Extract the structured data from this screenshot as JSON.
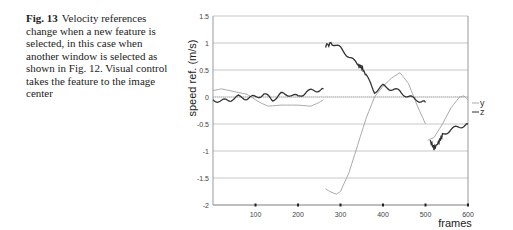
{
  "caption": {
    "label": "Fig. 13",
    "text": "Velocity references change when a new feature is selected, in this case when another window is selected as shown in Fig. 12. Visual control takes the feature to the image center"
  },
  "chart_data": {
    "type": "line",
    "title": "",
    "xlabel": "frames",
    "ylabel": "speed ref. (m/s)",
    "xlim": [
      0,
      600
    ],
    "ylim": [
      -2,
      1.5
    ],
    "xticks": [
      100,
      200,
      300,
      400,
      500,
      600
    ],
    "yticks": [
      1.5,
      1,
      0.5,
      0,
      -0.5,
      -1,
      -1.5,
      -2
    ],
    "grid": "horizontal",
    "legend_position": "right",
    "series": [
      {
        "name": "y",
        "color": "#aaaaaa",
        "segments": [
          {
            "x": [
              0,
              20,
              50,
              80,
              110,
              130,
              160,
              200,
              230,
              250,
              260
            ],
            "y": [
              0.12,
              0.15,
              0.1,
              0.05,
              -0.1,
              -0.17,
              -0.15,
              -0.15,
              -0.17,
              -0.1,
              -0.05
            ]
          },
          {
            "x": [
              265,
              275,
              290,
              300,
              320,
              340,
              360,
              380,
              400,
              420,
              440,
              460,
              480,
              500
            ],
            "y": [
              -1.7,
              -1.75,
              -1.8,
              -1.75,
              -1.4,
              -0.9,
              -0.4,
              0.0,
              0.2,
              0.35,
              0.45,
              0.25,
              -0.15,
              -0.5
            ]
          },
          {
            "x": [
              505,
              520,
              540,
              560,
              580,
              590,
              600
            ],
            "y": [
              -0.8,
              -0.75,
              -0.5,
              -0.2,
              0.0,
              0.02,
              -0.05
            ]
          }
        ]
      },
      {
        "name": "z",
        "color": "#333333",
        "segments": [
          {
            "x": [
              0,
              20,
              40,
              60,
              80,
              100,
              120,
              140,
              160,
              180,
              200,
              220,
              240,
              260
            ],
            "y": [
              -0.05,
              -0.08,
              -0.05,
              0.0,
              -0.02,
              0.0,
              0.05,
              -0.05,
              0.05,
              0.05,
              0.0,
              0.1,
              0.12,
              0.15
            ]
          },
          {
            "x": [
              265,
              280,
              300,
              320,
              340,
              350,
              360,
              380,
              400,
              420,
              440,
              460,
              480,
              500
            ],
            "y": [
              0.95,
              1.0,
              0.9,
              0.75,
              0.6,
              0.55,
              0.4,
              0.1,
              0.2,
              0.15,
              0.1,
              0.0,
              -0.05,
              -0.1
            ]
          },
          {
            "x": [
              510,
              520,
              530,
              540,
              560,
              580,
              600
            ],
            "y": [
              -0.8,
              -0.95,
              -0.85,
              -0.7,
              -0.6,
              -0.55,
              -0.5
            ]
          }
        ]
      }
    ]
  }
}
